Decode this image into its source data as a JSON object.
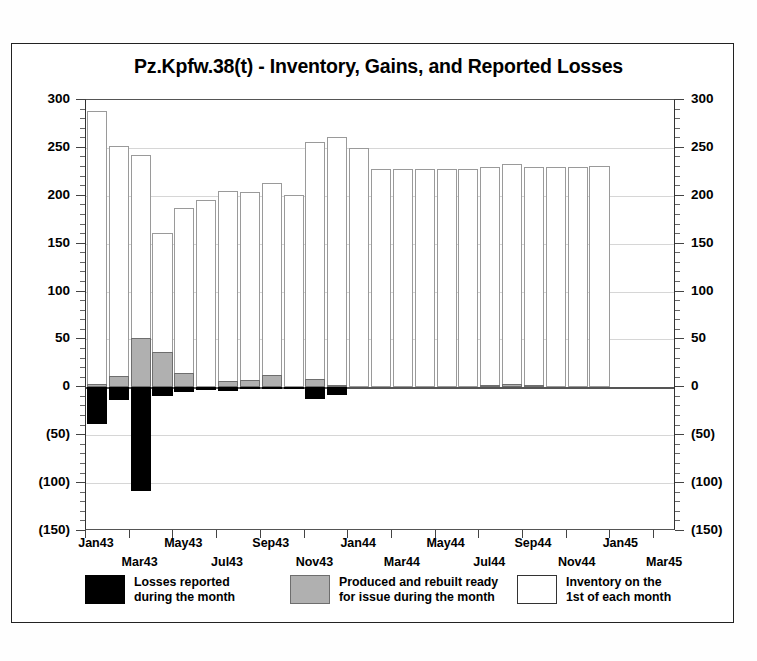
{
  "chart_data": {
    "type": "bar",
    "title": "Pz.Kpfw.38(t) - Inventory, Gains, and Reported Losses",
    "xlabel": "",
    "ylabel": "",
    "ylim": [
      -150,
      300
    ],
    "y_ticks": [
      300,
      250,
      200,
      150,
      100,
      50,
      0,
      -50,
      -100,
      -150
    ],
    "y_tick_labels": [
      "300",
      "250",
      "200",
      "150",
      "100",
      "50",
      "0",
      "(50)",
      "(100)",
      "(150)"
    ],
    "y_minor_interval": 10,
    "grid": true,
    "dual_y_axis": true,
    "legend_position": "bottom",
    "categories": [
      "Jan43",
      "Feb43",
      "Mar43",
      "Apr43",
      "May43",
      "Jun43",
      "Jul43",
      "Aug43",
      "Sep43",
      "Oct43",
      "Nov43",
      "Dec43",
      "Jan44",
      "Feb44",
      "Mar44",
      "Apr44",
      "May44",
      "Jun44",
      "Jul44",
      "Aug44",
      "Sep44",
      "Oct44",
      "Nov44",
      "Dec44",
      "Jan45",
      "Feb45",
      "Mar45"
    ],
    "x_tick_labels_row1": [
      "Jan43",
      "May43",
      "Sep43",
      "Jan44",
      "May44",
      "Sep44",
      "Jan45"
    ],
    "x_tick_labels_row2": [
      "Mar43",
      "Jul43",
      "Nov43",
      "Mar44",
      "Jul44",
      "Nov44",
      "Mar45"
    ],
    "x_tick_row1_indices": [
      0,
      4,
      8,
      12,
      16,
      20,
      24
    ],
    "x_tick_row2_indices": [
      2,
      6,
      10,
      14,
      18,
      22,
      26
    ],
    "series": [
      {
        "name": "Inventory on the 1st of each month",
        "key": "inventory",
        "color": "#ffffff",
        "edge_color": "#9a9a9a",
        "values": [
          288,
          252,
          243,
          161,
          187,
          196,
          205,
          204,
          213,
          201,
          256,
          261,
          250,
          228,
          228,
          228,
          228,
          228,
          230,
          233,
          230,
          230,
          230,
          231,
          null,
          null,
          null
        ]
      },
      {
        "name": "Produced and rebuilt ready for issue during the month",
        "key": "production",
        "color": "#b0b0b0",
        "edge_color": "#6e6e6e",
        "values": [
          4,
          12,
          52,
          37,
          15,
          0,
          7,
          8,
          13,
          0,
          9,
          2,
          0,
          0,
          0,
          0,
          0,
          0,
          2,
          3,
          2,
          0,
          0,
          0,
          null,
          null,
          null
        ]
      },
      {
        "name": "Losses reported during the month",
        "key": "losses",
        "color": "#000000",
        "edge_color": "#000000",
        "values": [
          -38,
          -13,
          -108,
          -9,
          -5,
          -3,
          -4,
          -2,
          -2,
          -1,
          -12,
          -8,
          0,
          0,
          0,
          0,
          0,
          0,
          0,
          0,
          0,
          0,
          0,
          0,
          null,
          null,
          null
        ]
      }
    ]
  },
  "legend": {
    "items": [
      {
        "swatch": "black",
        "label": "Losses reported\nduring the month"
      },
      {
        "swatch": "gray",
        "label": "Produced and rebuilt ready\nfor issue during the month"
      },
      {
        "swatch": "white",
        "label": "Inventory on the\n1st of each month"
      }
    ]
  }
}
